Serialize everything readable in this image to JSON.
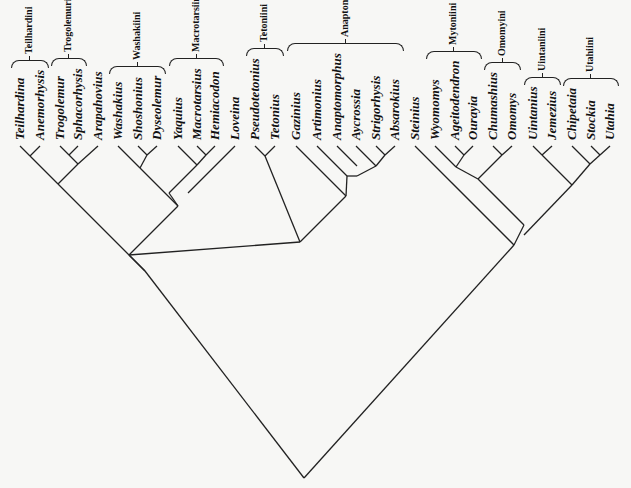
{
  "figure": {
    "type": "cladogram",
    "colors": {
      "line": "#222222",
      "text": "#111111",
      "background": "#f7f7f5"
    }
  },
  "leaves": [
    {
      "name": "Teilhardina",
      "x": 20
    },
    {
      "name": "Anemorhysis",
      "x": 40
    },
    {
      "name": "Trogolemur",
      "x": 60
    },
    {
      "name": "Sphacorhysis",
      "x": 78
    },
    {
      "name": "Arapahovius",
      "x": 98
    },
    {
      "name": "Washakius",
      "x": 118
    },
    {
      "name": "Shoshonius",
      "x": 138
    },
    {
      "name": "Dyseolemur",
      "x": 157
    },
    {
      "name": "Yaquius",
      "x": 178
    },
    {
      "name": "Macrotarsius",
      "x": 197
    },
    {
      "name": "Hemiacodon",
      "x": 215
    },
    {
      "name": "Loveina",
      "x": 235
    },
    {
      "name": "Pseudotetonius",
      "x": 255
    },
    {
      "name": "Tetonius",
      "x": 275
    },
    {
      "name": "Gazinius",
      "x": 296
    },
    {
      "name": "Artimonius",
      "x": 317
    },
    {
      "name": "Anaptomorphus",
      "x": 337
    },
    {
      "name": "Aycrossia",
      "x": 356
    },
    {
      "name": "Strigorhysis",
      "x": 376
    },
    {
      "name": "Absarokius",
      "x": 395
    },
    {
      "name": "Steinius",
      "x": 415
    },
    {
      "name": "Wyomomys",
      "x": 435
    },
    {
      "name": "Ageitodendron",
      "x": 455
    },
    {
      "name": "Ourayia",
      "x": 473
    },
    {
      "name": "Chumashius",
      "x": 493
    },
    {
      "name": "Omomys",
      "x": 512
    },
    {
      "name": "Uintanius",
      "x": 533
    },
    {
      "name": "Jemezius",
      "x": 552
    },
    {
      "name": "Chipetaia",
      "x": 572
    },
    {
      "name": "Stockia",
      "x": 591
    },
    {
      "name": "Utahia",
      "x": 610
    }
  ],
  "tribes": [
    {
      "name": "Teilhardini",
      "from": 0,
      "to": 1
    },
    {
      "name": "Trogolemurini",
      "from": 2,
      "to": 3
    },
    {
      "name": "Washakiini",
      "from": 5,
      "to": 7
    },
    {
      "name": "Macrotarsiini",
      "from": 8,
      "to": 10
    },
    {
      "name": "Tetoniini",
      "from": 12,
      "to": 13
    },
    {
      "name": "Anaptomorphini",
      "from": 14,
      "to": 19
    },
    {
      "name": "Mytoniini",
      "from": 21,
      "to": 23
    },
    {
      "name": "Omomyini",
      "from": 24,
      "to": 25
    },
    {
      "name": "Uintaniini",
      "from": 26,
      "to": 27
    },
    {
      "name": "Utahiini",
      "from": 28,
      "to": 30
    }
  ],
  "topology": "((((Teilhardina,Anemorhysis),((Trogolemur,Sphacorhysis),Arapahovius)),(((Washakius,(Shoshonius,Dyseolemur)),((Yaquius,(Macrotarsius,Hemiacodon)),Loveina)),((Pseudotetonius,Tetonius),(Gazinius,(Artimonius,(Anaptomorphus,(Aycrossia,(Strigorhysis,Absarokius)))))))),(Steinius,((Wyomomys,(Ageitodendron,Ourayia)),(Chumashius,Omomys))),((Uintanius,Jemezius),(Chipetaia,(Stockia,Utahia))))",
  "tree": {
    "tip_y": 146,
    "root": {
      "x": 304,
      "y": 478
    },
    "edges": [
      [
        20,
        146,
        30,
        156
      ],
      [
        40,
        146,
        30,
        156
      ],
      [
        60,
        146,
        69,
        155
      ],
      [
        78,
        146,
        69,
        155
      ],
      [
        69,
        155,
        78,
        164
      ],
      [
        98,
        146,
        78,
        164
      ],
      [
        30,
        156,
        58,
        184
      ],
      [
        78,
        164,
        58,
        184
      ],
      [
        138,
        146,
        147,
        155
      ],
      [
        157,
        146,
        147,
        155
      ],
      [
        118,
        146,
        140,
        168
      ],
      [
        147,
        155,
        140,
        168
      ],
      [
        197,
        146,
        206,
        155
      ],
      [
        215,
        146,
        206,
        155
      ],
      [
        178,
        146,
        197,
        165
      ],
      [
        206,
        155,
        197,
        165
      ],
      [
        197,
        165,
        169,
        193
      ],
      [
        235,
        146,
        188,
        193
      ],
      [
        140,
        168,
        178,
        206
      ],
      [
        169,
        193,
        178,
        206
      ],
      [
        255,
        146,
        265,
        156
      ],
      [
        275,
        146,
        265,
        156
      ],
      [
        376,
        146,
        385,
        155
      ],
      [
        395,
        146,
        385,
        155
      ],
      [
        356,
        146,
        376,
        166
      ],
      [
        385,
        155,
        376,
        166
      ],
      [
        337,
        146,
        357,
        166
      ],
      [
        376,
        166,
        357,
        176
      ],
      [
        317,
        146,
        347,
        176
      ],
      [
        357,
        176,
        347,
        176
      ],
      [
        296,
        146,
        346,
        196
      ],
      [
        347,
        176,
        346,
        196
      ],
      [
        346,
        196,
        300,
        242
      ],
      [
        265,
        156,
        300,
        242
      ],
      [
        178,
        206,
        129,
        255
      ],
      [
        300,
        242,
        129,
        255
      ],
      [
        58,
        184,
        145,
        271
      ],
      [
        129,
        255,
        145,
        271
      ],
      [
        455,
        146,
        464,
        155
      ],
      [
        473,
        146,
        464,
        155
      ],
      [
        435,
        146,
        456,
        167
      ],
      [
        464,
        155,
        456,
        167
      ],
      [
        493,
        146,
        502,
        155
      ],
      [
        512,
        146,
        502,
        155
      ],
      [
        502,
        155,
        478,
        179
      ],
      [
        456,
        167,
        478,
        179
      ],
      [
        415,
        146,
        514,
        245
      ],
      [
        478,
        179,
        524,
        225
      ],
      [
        533,
        146,
        542,
        155
      ],
      [
        552,
        146,
        542,
        155
      ],
      [
        591,
        146,
        600,
        155
      ],
      [
        610,
        146,
        600,
        155
      ],
      [
        572,
        146,
        590,
        164
      ],
      [
        600,
        155,
        590,
        164
      ],
      [
        542,
        155,
        572,
        185
      ],
      [
        590,
        164,
        572,
        185
      ],
      [
        524,
        225,
        514,
        245
      ],
      [
        572,
        185,
        524,
        235
      ],
      [
        514,
        245,
        304,
        478
      ],
      [
        145,
        271,
        304,
        478
      ]
    ]
  }
}
